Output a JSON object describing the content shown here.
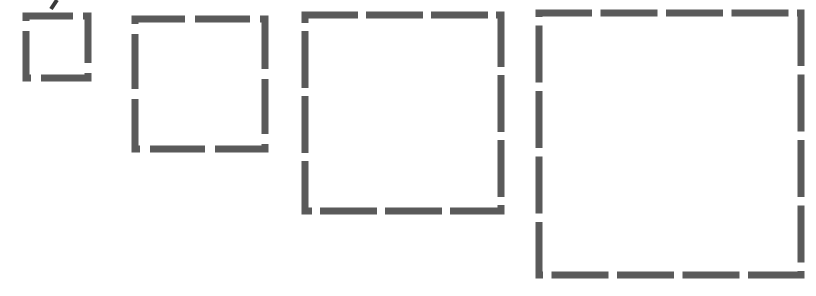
{
  "canvas": {
    "width": 816,
    "height": 296,
    "background_color": "#ffffff",
    "title": "Dashed Squares Progression"
  },
  "style": {
    "stroke_color": "#5a5a5a",
    "stroke_width": 7,
    "stroke_linecap": "butt",
    "fill": "none"
  },
  "figure_data": {
    "type": "diagram",
    "description": "Four hollow squares of increasing size drawn with dashed gray outlines; the number of dashes per side increases 1, 2, 3, 4 from left to right.",
    "shape_count": 4,
    "shapes": [
      {
        "name": "square-1",
        "label": "Square 1",
        "x": 26,
        "y": 16,
        "size": 62,
        "dashes_per_side": 1,
        "dash_length": 52,
        "gap_length": 10,
        "dash_offset": 5
      },
      {
        "name": "square-2",
        "label": "Square 2",
        "x": 135,
        "y": 19,
        "size": 130,
        "dashes_per_side": 2,
        "dash_length": 55,
        "gap_length": 10,
        "dash_offset": 5
      },
      {
        "name": "square-3",
        "label": "Square 3",
        "x": 305,
        "y": 15,
        "size": 196,
        "dashes_per_side": 3,
        "dash_length": 57,
        "gap_length": 8,
        "dash_offset": 4
      },
      {
        "name": "square-4",
        "label": "Square 4",
        "x": 539,
        "y": 13,
        "size": 262,
        "dashes_per_side": 4,
        "dash_length": 57,
        "gap_length": 8.5,
        "dash_offset": 4
      }
    ],
    "stray_mark": {
      "name": "stray-diagonal-mark",
      "label": "Stray diagonal mark",
      "x1": 57,
      "y1": 0,
      "x2": 51,
      "y2": 9,
      "stroke_width": 4,
      "color": "#3a3a3a"
    }
  }
}
